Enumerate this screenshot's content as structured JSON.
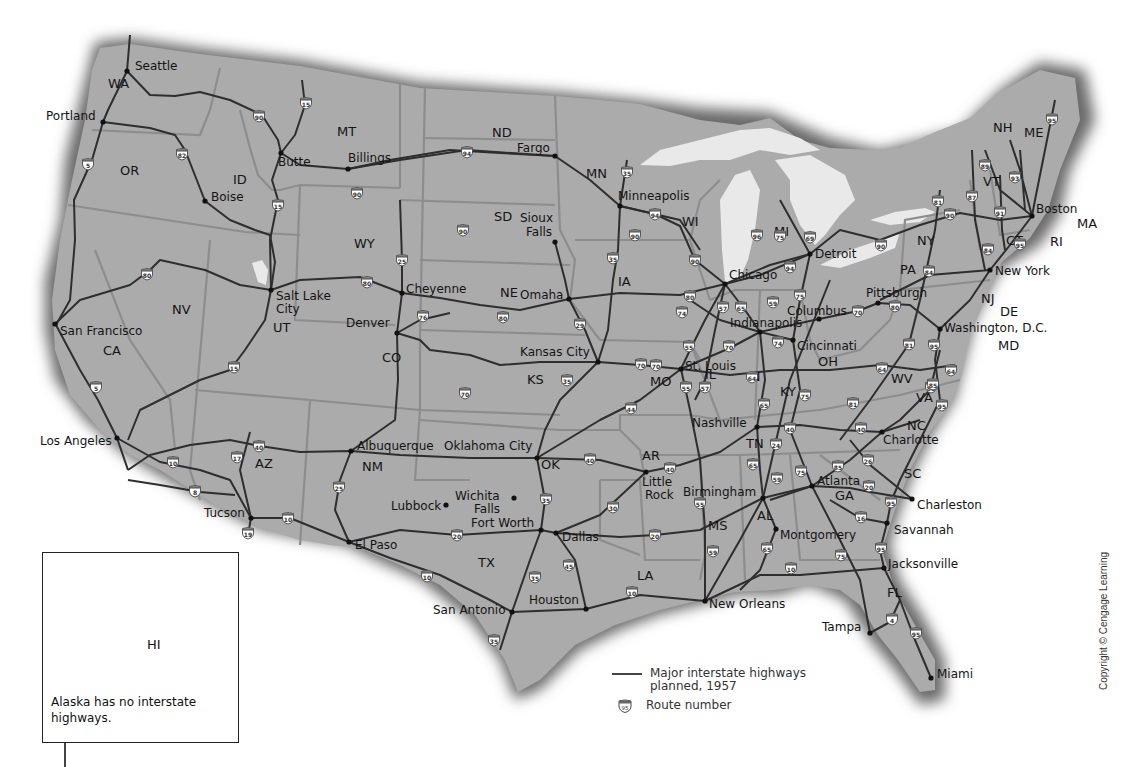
{
  "map": {
    "title": "Interstate Highway System",
    "colors": {
      "land": "#a9a9a9",
      "state_border": "#8a8a8a",
      "highway": "#2e2e2e",
      "water": "#e8e8e8",
      "shadow": "#5a5a5a"
    },
    "states": [
      {
        "abbr": "WA",
        "x": 108,
        "y": 88
      },
      {
        "abbr": "OR",
        "x": 120,
        "y": 175
      },
      {
        "abbr": "ID",
        "x": 233,
        "y": 184
      },
      {
        "abbr": "MT",
        "x": 337,
        "y": 136
      },
      {
        "abbr": "ND",
        "x": 492,
        "y": 137
      },
      {
        "abbr": "MN",
        "x": 586,
        "y": 178
      },
      {
        "abbr": "SD",
        "x": 494,
        "y": 221
      },
      {
        "abbr": "WI",
        "x": 682,
        "y": 226
      },
      {
        "abbr": "WY",
        "x": 354,
        "y": 248
      },
      {
        "abbr": "NE",
        "x": 500,
        "y": 297
      },
      {
        "abbr": "IA",
        "x": 618,
        "y": 286
      },
      {
        "abbr": "MI",
        "x": 774,
        "y": 236
      },
      {
        "abbr": "NV",
        "x": 172,
        "y": 314
      },
      {
        "abbr": "UT",
        "x": 273,
        "y": 332
      },
      {
        "abbr": "CO",
        "x": 382,
        "y": 362
      },
      {
        "abbr": "KS",
        "x": 527,
        "y": 384
      },
      {
        "abbr": "MO",
        "x": 650,
        "y": 386
      },
      {
        "abbr": "IL",
        "x": 705,
        "y": 379
      },
      {
        "abbr": "IN",
        "x": 747,
        "y": 381
      },
      {
        "abbr": "OH",
        "x": 818,
        "y": 366
      },
      {
        "abbr": "CA",
        "x": 103,
        "y": 355
      },
      {
        "abbr": "AZ",
        "x": 255,
        "y": 468
      },
      {
        "abbr": "NM",
        "x": 362,
        "y": 471
      },
      {
        "abbr": "OK",
        "x": 541,
        "y": 469
      },
      {
        "abbr": "AR",
        "x": 642,
        "y": 460
      },
      {
        "abbr": "TN",
        "x": 746,
        "y": 448
      },
      {
        "abbr": "KY",
        "x": 780,
        "y": 396
      },
      {
        "abbr": "WV",
        "x": 891,
        "y": 383
      },
      {
        "abbr": "VA",
        "x": 916,
        "y": 402
      },
      {
        "abbr": "NC",
        "x": 907,
        "y": 430
      },
      {
        "abbr": "SC",
        "x": 904,
        "y": 478
      },
      {
        "abbr": "GA",
        "x": 835,
        "y": 500
      },
      {
        "abbr": "AL",
        "x": 757,
        "y": 520
      },
      {
        "abbr": "MS",
        "x": 708,
        "y": 530
      },
      {
        "abbr": "LA",
        "x": 637,
        "y": 580
      },
      {
        "abbr": "TX",
        "x": 478,
        "y": 567
      },
      {
        "abbr": "FL",
        "x": 887,
        "y": 597
      },
      {
        "abbr": "PA",
        "x": 900,
        "y": 274
      },
      {
        "abbr": "NY",
        "x": 917,
        "y": 245
      },
      {
        "abbr": "NJ",
        "x": 981,
        "y": 303
      },
      {
        "abbr": "DE",
        "x": 1000,
        "y": 316
      },
      {
        "abbr": "MD",
        "x": 998,
        "y": 350
      },
      {
        "abbr": "CT",
        "x": 1006,
        "y": 245
      },
      {
        "abbr": "RI",
        "x": 1050,
        "y": 246
      },
      {
        "abbr": "MA",
        "x": 1077,
        "y": 228
      },
      {
        "abbr": "VT",
        "x": 983,
        "y": 186
      },
      {
        "abbr": "NH",
        "x": 993,
        "y": 132
      },
      {
        "abbr": "ME",
        "x": 1024,
        "y": 137
      },
      {
        "abbr": "HI",
        "x": 151,
        "y": 644
      }
    ],
    "cities": [
      {
        "name": "Seattle",
        "x": 127,
        "y": 71,
        "lx": 135,
        "ly": 70
      },
      {
        "name": "Portland",
        "x": 103,
        "y": 122,
        "lx": 46,
        "ly": 120
      },
      {
        "name": "Boise",
        "x": 205,
        "y": 201,
        "lx": 211,
        "ly": 201
      },
      {
        "name": "Butte",
        "x": 281,
        "y": 153,
        "lx": 278,
        "ly": 166
      },
      {
        "name": "Billings",
        "x": 348,
        "y": 169,
        "lx": 348,
        "ly": 162
      },
      {
        "name": "Fargo",
        "x": 555,
        "y": 156,
        "lx": 517,
        "ly": 152
      },
      {
        "name": "Minneapolis",
        "x": 620,
        "y": 206,
        "lx": 618,
        "ly": 200
      },
      {
        "name": "Sioux Falls",
        "x": 555,
        "y": 242,
        "lx": 520,
        "ly": 222,
        "line2": "Falls",
        "lx2": 526,
        "ly2": 236
      },
      {
        "name": "Chicago",
        "x": 725,
        "y": 284,
        "lx": 729,
        "ly": 279
      },
      {
        "name": "Detroit",
        "x": 810,
        "y": 254,
        "lx": 815,
        "ly": 258
      },
      {
        "name": "Boston",
        "x": 1032,
        "y": 216,
        "lx": 1036,
        "ly": 213
      },
      {
        "name": "New York",
        "x": 990,
        "y": 270,
        "lx": 995,
        "ly": 275
      },
      {
        "name": "Pittsburgh",
        "x": 878,
        "y": 303,
        "lx": 866,
        "ly": 297
      },
      {
        "name": "Columbus",
        "x": 819,
        "y": 319,
        "lx": 787,
        "ly": 315
      },
      {
        "name": "Indianapolis",
        "x": 760,
        "y": 332,
        "lx": 730,
        "ly": 327
      },
      {
        "name": "Cincinnati",
        "x": 793,
        "y": 340,
        "lx": 797,
        "ly": 350
      },
      {
        "name": "Washington, D.C.",
        "x": 940,
        "y": 329,
        "lx": 944,
        "ly": 332
      },
      {
        "name": "St. Louis",
        "x": 681,
        "y": 369,
        "lx": 685,
        "ly": 370
      },
      {
        "name": "Salt Lake City",
        "x": 271,
        "y": 290,
        "lx": 276,
        "ly": 300,
        "line2": "City",
        "lx2": 276,
        "ly2": 313
      },
      {
        "name": "Cheyenne",
        "x": 402,
        "y": 293,
        "lx": 406,
        "ly": 293
      },
      {
        "name": "Omaha",
        "x": 569,
        "y": 299,
        "lx": 520,
        "ly": 299
      },
      {
        "name": "Denver",
        "x": 397,
        "y": 333,
        "lx": 346,
        "ly": 327
      },
      {
        "name": "Kansas City",
        "x": 598,
        "y": 362,
        "lx": 520,
        "ly": 356
      },
      {
        "name": "San Francisco",
        "x": 55,
        "y": 324,
        "lx": 60,
        "ly": 335
      },
      {
        "name": "Los Angeles",
        "x": 117,
        "y": 438,
        "lx": 40,
        "ly": 445
      },
      {
        "name": "Albuquerque",
        "x": 351,
        "y": 451,
        "lx": 357,
        "ly": 450
      },
      {
        "name": "Oklahoma City",
        "x": 537,
        "y": 458,
        "lx": 444,
        "ly": 450
      },
      {
        "name": "Nashville",
        "x": 757,
        "y": 427,
        "lx": 692,
        "ly": 427
      },
      {
        "name": "Charlotte",
        "x": 882,
        "y": 432,
        "lx": 883,
        "ly": 444
      },
      {
        "name": "Little Rock",
        "x": 646,
        "y": 472,
        "lx": 642,
        "ly": 486,
        "line2": "Rock",
        "lx2": 645,
        "ly2": 499
      },
      {
        "name": "Atlanta",
        "x": 812,
        "y": 486,
        "lx": 817,
        "ly": 485
      },
      {
        "name": "Birmingham",
        "x": 763,
        "y": 498,
        "lx": 683,
        "ly": 496
      },
      {
        "name": "Charleston",
        "x": 912,
        "y": 499,
        "lx": 917,
        "ly": 509
      },
      {
        "name": "Lubbock",
        "x": 446,
        "y": 505,
        "lx": 391,
        "ly": 510
      },
      {
        "name": "Wichita Falls",
        "x": 514,
        "y": 498,
        "lx": 455,
        "ly": 500,
        "line2": "Falls",
        "lx2": 474,
        "ly2": 513
      },
      {
        "name": "Fort Worth",
        "x": 541,
        "y": 530,
        "lx": 471,
        "ly": 527
      },
      {
        "name": "Dallas",
        "x": 556,
        "y": 533,
        "lx": 562,
        "ly": 541
      },
      {
        "name": "Tucson",
        "x": 251,
        "y": 518,
        "lx": 204,
        "ly": 517
      },
      {
        "name": "El Paso",
        "x": 349,
        "y": 542,
        "lx": 355,
        "ly": 549
      },
      {
        "name": "Montgomery",
        "x": 776,
        "y": 529,
        "lx": 780,
        "ly": 539
      },
      {
        "name": "Savannah",
        "x": 887,
        "y": 523,
        "lx": 894,
        "ly": 534
      },
      {
        "name": "Jacksonville",
        "x": 884,
        "y": 568,
        "lx": 888,
        "ly": 568
      },
      {
        "name": "Houston",
        "x": 586,
        "y": 609,
        "lx": 529,
        "ly": 604
      },
      {
        "name": "San Antonio",
        "x": 512,
        "y": 612,
        "lx": 433,
        "ly": 614
      },
      {
        "name": "New Orleans",
        "x": 705,
        "y": 601,
        "lx": 709,
        "ly": 608
      },
      {
        "name": "Tampa",
        "x": 870,
        "y": 633,
        "lx": 822,
        "ly": 631
      },
      {
        "name": "Miami",
        "x": 931,
        "y": 678,
        "lx": 937,
        "ly": 678
      },
      {
        "name": "Honolulu",
        "x": 133,
        "y": 596,
        "lx": 140,
        "ly": 592
      }
    ],
    "shields": [
      {
        "n": "5",
        "x": 88,
        "y": 164
      },
      {
        "n": "82",
        "x": 182,
        "y": 154
      },
      {
        "n": "90",
        "x": 259,
        "y": 116
      },
      {
        "n": "15",
        "x": 306,
        "y": 103
      },
      {
        "n": "15",
        "x": 278,
        "y": 205
      },
      {
        "n": "90",
        "x": 357,
        "y": 193
      },
      {
        "n": "94",
        "x": 467,
        "y": 152
      },
      {
        "n": "35",
        "x": 627,
        "y": 172
      },
      {
        "n": "94",
        "x": 655,
        "y": 214
      },
      {
        "n": "90",
        "x": 463,
        "y": 230
      },
      {
        "n": "90",
        "x": 635,
        "y": 235
      },
      {
        "n": "25",
        "x": 402,
        "y": 260
      },
      {
        "n": "35",
        "x": 613,
        "y": 258
      },
      {
        "n": "90",
        "x": 695,
        "y": 260
      },
      {
        "n": "80",
        "x": 147,
        "y": 274
      },
      {
        "n": "80",
        "x": 367,
        "y": 282
      },
      {
        "n": "80",
        "x": 503,
        "y": 317
      },
      {
        "n": "76",
        "x": 423,
        "y": 316
      },
      {
        "n": "29",
        "x": 580,
        "y": 324
      },
      {
        "n": "80",
        "x": 690,
        "y": 296
      },
      {
        "n": "74",
        "x": 682,
        "y": 312
      },
      {
        "n": "57",
        "x": 723,
        "y": 307
      },
      {
        "n": "65",
        "x": 741,
        "y": 307
      },
      {
        "n": "59",
        "x": 773,
        "y": 302
      },
      {
        "n": "75",
        "x": 800,
        "y": 295
      },
      {
        "n": "75",
        "x": 780,
        "y": 236
      },
      {
        "n": "96",
        "x": 757,
        "y": 235
      },
      {
        "n": "69",
        "x": 810,
        "y": 237
      },
      {
        "n": "94",
        "x": 790,
        "y": 267
      },
      {
        "n": "90",
        "x": 881,
        "y": 245
      },
      {
        "n": "90",
        "x": 950,
        "y": 214
      },
      {
        "n": "81",
        "x": 938,
        "y": 201
      },
      {
        "n": "87",
        "x": 972,
        "y": 196
      },
      {
        "n": "89",
        "x": 985,
        "y": 165
      },
      {
        "n": "93",
        "x": 1015,
        "y": 177
      },
      {
        "n": "95",
        "x": 1052,
        "y": 119
      },
      {
        "n": "91",
        "x": 1000,
        "y": 212
      },
      {
        "n": "84",
        "x": 988,
        "y": 249
      },
      {
        "n": "84",
        "x": 929,
        "y": 271
      },
      {
        "n": "95",
        "x": 1020,
        "y": 244
      },
      {
        "n": "80",
        "x": 895,
        "y": 306
      },
      {
        "n": "70",
        "x": 858,
        "y": 311
      },
      {
        "n": "74",
        "x": 778,
        "y": 342
      },
      {
        "n": "70",
        "x": 729,
        "y": 346
      },
      {
        "n": "55",
        "x": 689,
        "y": 346
      },
      {
        "n": "70",
        "x": 656,
        "y": 365
      },
      {
        "n": "15",
        "x": 234,
        "y": 367
      },
      {
        "n": "5",
        "x": 96,
        "y": 387
      },
      {
        "n": "70",
        "x": 465,
        "y": 393
      },
      {
        "n": "70",
        "x": 641,
        "y": 364
      },
      {
        "n": "35",
        "x": 567,
        "y": 380
      },
      {
        "n": "55",
        "x": 686,
        "y": 387
      },
      {
        "n": "57",
        "x": 705,
        "y": 387
      },
      {
        "n": "64",
        "x": 752,
        "y": 377
      },
      {
        "n": "65",
        "x": 764,
        "y": 404
      },
      {
        "n": "75",
        "x": 805,
        "y": 395
      },
      {
        "n": "81",
        "x": 853,
        "y": 403
      },
      {
        "n": "64",
        "x": 882,
        "y": 368
      },
      {
        "n": "81",
        "x": 909,
        "y": 344
      },
      {
        "n": "95",
        "x": 934,
        "y": 345
      },
      {
        "n": "64",
        "x": 951,
        "y": 370
      },
      {
        "n": "85",
        "x": 931,
        "y": 387
      },
      {
        "n": "95",
        "x": 942,
        "y": 405
      },
      {
        "n": "44",
        "x": 631,
        "y": 408
      },
      {
        "n": "40",
        "x": 259,
        "y": 446
      },
      {
        "n": "17",
        "x": 237,
        "y": 457
      },
      {
        "n": "10",
        "x": 173,
        "y": 462
      },
      {
        "n": "8",
        "x": 195,
        "y": 491
      },
      {
        "n": "10",
        "x": 288,
        "y": 518
      },
      {
        "n": "19",
        "x": 248,
        "y": 533
      },
      {
        "n": "25",
        "x": 339,
        "y": 487
      },
      {
        "n": "40",
        "x": 590,
        "y": 459
      },
      {
        "n": "40",
        "x": 670,
        "y": 468
      },
      {
        "n": "35",
        "x": 546,
        "y": 499
      },
      {
        "n": "30",
        "x": 613,
        "y": 507
      },
      {
        "n": "20",
        "x": 457,
        "y": 535
      },
      {
        "n": "20",
        "x": 655,
        "y": 535
      },
      {
        "n": "10",
        "x": 427,
        "y": 576
      },
      {
        "n": "35",
        "x": 535,
        "y": 577
      },
      {
        "n": "45",
        "x": 569,
        "y": 565
      },
      {
        "n": "10",
        "x": 632,
        "y": 592
      },
      {
        "n": "35",
        "x": 494,
        "y": 640
      },
      {
        "n": "55",
        "x": 700,
        "y": 503
      },
      {
        "n": "59",
        "x": 713,
        "y": 551
      },
      {
        "n": "40",
        "x": 790,
        "y": 428
      },
      {
        "n": "24",
        "x": 776,
        "y": 444
      },
      {
        "n": "40",
        "x": 861,
        "y": 428
      },
      {
        "n": "65",
        "x": 753,
        "y": 464
      },
      {
        "n": "59",
        "x": 777,
        "y": 478
      },
      {
        "n": "75",
        "x": 801,
        "y": 471
      },
      {
        "n": "85",
        "x": 838,
        "y": 466
      },
      {
        "n": "26",
        "x": 868,
        "y": 460
      },
      {
        "n": "20",
        "x": 869,
        "y": 486
      },
      {
        "n": "95",
        "x": 891,
        "y": 502
      },
      {
        "n": "16",
        "x": 861,
        "y": 517
      },
      {
        "n": "65",
        "x": 767,
        "y": 548
      },
      {
        "n": "75",
        "x": 841,
        "y": 555
      },
      {
        "n": "95",
        "x": 881,
        "y": 548
      },
      {
        "n": "10",
        "x": 791,
        "y": 568
      },
      {
        "n": "4",
        "x": 892,
        "y": 619
      },
      {
        "n": "95",
        "x": 916,
        "y": 633
      },
      {
        "n": "85",
        "x": 933,
        "y": 384
      },
      {
        "n": "H1",
        "x": 100,
        "y": 591
      },
      {
        "n": "H2",
        "x": 139,
        "y": 571
      },
      {
        "n": "H3",
        "x": 119,
        "y": 614
      }
    ]
  },
  "inset": {
    "label": "HI",
    "note": "Alaska has no interstate highways."
  },
  "legend": {
    "highway_label_line1": "Major interstate highways",
    "highway_label_line2": "planned, 1957",
    "route_number_label": "Route number",
    "route_shield_example": "95"
  },
  "copyright": "Copyright © Cengage Learning"
}
